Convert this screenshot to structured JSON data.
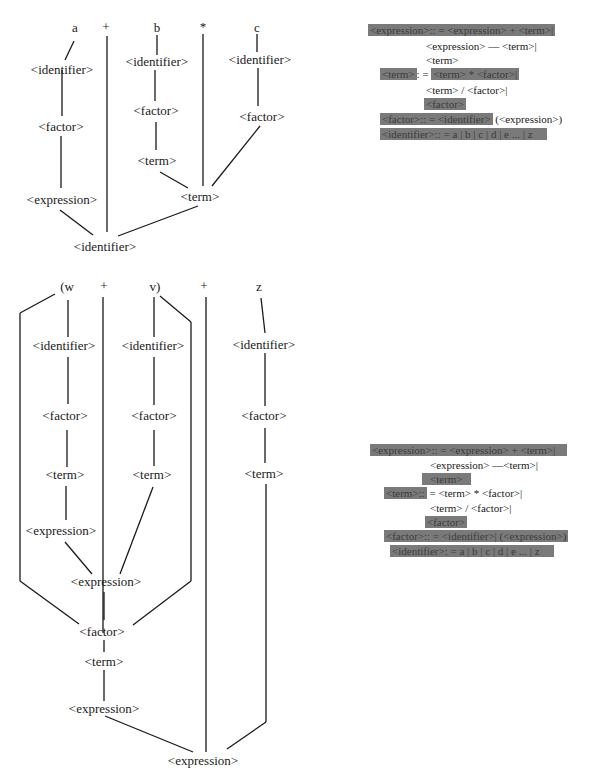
{
  "tree1": {
    "tokens": [
      "a",
      "+",
      "b",
      "*",
      "c"
    ],
    "nodes": {
      "a_identifier": "<identifier>",
      "a_factor": "<factor>",
      "a_expression": "<expression>",
      "b_identifier": "<identifier>",
      "b_factor": "<factor>",
      "b_term": "<term>",
      "c_identifier": "<identifier>",
      "c_factor": "<factor>",
      "term_product": "<term>",
      "root": "<identifier>"
    }
  },
  "grammar1": {
    "lines": [
      {
        "hl": "<expression>:: = <expression> + <term>|",
        "rest": ""
      },
      {
        "hl": "",
        "rest": "<expression> — <term>|"
      },
      {
        "hl": "",
        "rest": "<term>"
      },
      {
        "hl_a": "<term>",
        "mid": ": = ",
        "hl_b": "<term> * <factor>|"
      },
      {
        "hl": "",
        "rest": "<term> / <factor>|"
      },
      {
        "hl": "<factor>",
        "rest": ""
      },
      {
        "hl": "<factor>:: = <identifier>",
        "rest": "(<expression>)"
      },
      {
        "hl": "<identifier>:: = a | b | c | d | e ... | z",
        "rest": ""
      }
    ]
  },
  "tree2": {
    "tokens": [
      "(w",
      "+",
      "v)",
      "+",
      "z"
    ],
    "nodes": {
      "w_identifier": "<identifier>",
      "w_factor": "<factor>",
      "w_term": "<term>",
      "w_expression": "<expression>",
      "v_identifier": "<identifier>",
      "v_factor": "<factor>",
      "v_term": "<term>",
      "z_identifier": "<identifier>",
      "z_factor": "<factor>",
      "z_term": "<term>",
      "inner_expression": "<expression>",
      "paren_factor": "<factor>",
      "paren_term": "<term>",
      "paren_expression": "<expression>",
      "root": "<expression>"
    }
  },
  "grammar2": {
    "lines": [
      {
        "hl": "<expression>:: = <expression> + <term>|",
        "rest": ""
      },
      {
        "hl": "",
        "rest": "<expression> —<term>|"
      },
      {
        "hl": "<term>",
        "rest": ""
      },
      {
        "hl": "<term>::",
        "rest": "= <term> * <factor>|"
      },
      {
        "hl": "",
        "rest": "<term> / <factor>|"
      },
      {
        "hl": "<factor>",
        "rest": ""
      },
      {
        "hl": "<factor>:: = <identifier>| (<expression>)",
        "rest": ""
      },
      {
        "hl": "<identifier>: = a | b | c | d | e ... | z",
        "rest": ""
      }
    ]
  },
  "colors": {
    "line": "#1a1a1a",
    "highlight": "#7a7a7a",
    "text": "#1a1a1a"
  }
}
